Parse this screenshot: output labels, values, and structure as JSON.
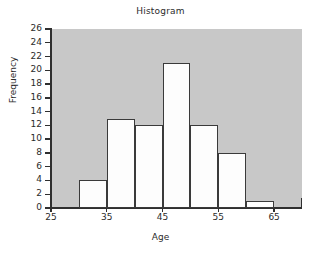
{
  "chart_data": {
    "type": "bar",
    "title": "Histogram",
    "xlabel": "Age",
    "ylabel": "Frequency",
    "categories": [
      "30-35",
      "35-40",
      "40-45",
      "45-50",
      "50-55",
      "55-60",
      "60-65"
    ],
    "bin_starts": [
      30,
      35,
      40,
      45,
      50,
      55,
      60
    ],
    "bin_width": 5,
    "values": [
      4,
      13,
      12,
      21,
      12,
      8,
      1
    ],
    "xlim": [
      25,
      70
    ],
    "ylim": [
      0,
      26
    ],
    "x_ticks": [
      25,
      35,
      45,
      55,
      65
    ],
    "x_tick_labels": [
      "25",
      "35",
      "45",
      "55",
      "65"
    ],
    "y_ticks": [
      0,
      2,
      4,
      6,
      8,
      10,
      12,
      14,
      16,
      18,
      20,
      22,
      24,
      26
    ],
    "y_tick_labels": [
      "0",
      "2",
      "4",
      "6",
      "8",
      "10",
      "12",
      "14",
      "16",
      "18",
      "20",
      "22",
      "24",
      "26"
    ],
    "grid": false,
    "legend": null,
    "colors": {
      "plot_background": "#c8c8c8",
      "bar_fill": "#fdfdfd",
      "bar_edge": "#3a3a3a",
      "axis": "#2f2f2f",
      "text": "#2b2b2b",
      "page_background": "#ffffff"
    }
  }
}
